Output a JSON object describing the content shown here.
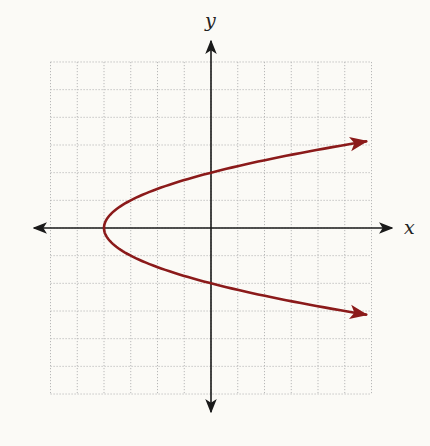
{
  "chart_data": {
    "type": "line",
    "title": "",
    "xlabel": "x",
    "ylabel": "y",
    "xlim": [
      -6,
      6
    ],
    "ylim": [
      -6,
      6
    ],
    "grid": true,
    "grid_style": "dotted",
    "grid_step": 1,
    "tick_labels_shown": false,
    "axes_arrows": true,
    "series": [
      {
        "name": "parabola",
        "equation": "x = y^2 - 4",
        "color": "#8b1a1a",
        "vertex": [
          -4,
          0
        ],
        "y_intercepts": [
          2,
          -2
        ],
        "arrow_ends": true,
        "points": [
          [
            5.8,
            3.13
          ],
          [
            5,
            3
          ],
          [
            2.25,
            2.5
          ],
          [
            0,
            2
          ],
          [
            -1.75,
            1.5
          ],
          [
            -3,
            1
          ],
          [
            -3.75,
            0.5
          ],
          [
            -4,
            0
          ],
          [
            -3.75,
            -0.5
          ],
          [
            -3,
            -1
          ],
          [
            -1.75,
            -1.5
          ],
          [
            0,
            -2
          ],
          [
            2.25,
            -2.5
          ],
          [
            5,
            -3
          ],
          [
            5.8,
            -3.13
          ]
        ]
      }
    ]
  },
  "axes": {
    "x_label": "x",
    "y_label": "y"
  },
  "colors": {
    "background": "#fbfaf6",
    "grid": "#b8b8b8",
    "axis": "#1a1a1a",
    "curve": "#8b1a1a"
  }
}
